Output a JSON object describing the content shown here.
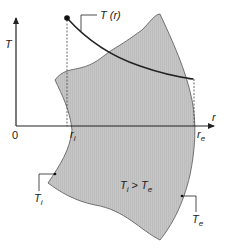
{
  "figure": {
    "colors": {
      "shape_fill": "#c8c8c8",
      "stroke": "#222222",
      "background": "#ffffff"
    },
    "axes": {
      "y_label": "T",
      "x_label": "r",
      "origin_label": "0"
    },
    "labels": {
      "curve": "T (r)",
      "r_inner_main": "r",
      "r_inner_sub": "i",
      "r_outer_main": "r",
      "r_outer_sub": "e",
      "t_inner_main": "T",
      "t_inner_sub": "i",
      "t_outer_main": "T",
      "t_outer_sub": "e",
      "condition_t1": "T",
      "condition_t1_sub": "i",
      "condition_op": " > ",
      "condition_t2": "T",
      "condition_t2_sub": "e"
    }
  }
}
